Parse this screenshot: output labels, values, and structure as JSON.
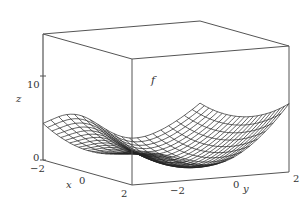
{
  "chart_data": {
    "type": "surface",
    "title": "",
    "function_label": "f",
    "xlabel": "x",
    "ylabel": "y",
    "zlabel": "z",
    "x_ticks": [
      "-2",
      "0",
      "2"
    ],
    "y_ticks": [
      "-2",
      "0",
      "2"
    ],
    "z_ticks": [
      "0",
      "10"
    ],
    "xlim": [
      -2,
      2
    ],
    "ylim": [
      -2,
      2
    ],
    "zlim": [
      0,
      15
    ],
    "grid_resolution": 20,
    "box": true,
    "line_color": "#222222",
    "box_color": "#555555"
  },
  "labels": {
    "z_axis": "z",
    "z_tick_0": "0",
    "z_tick_10": "10",
    "x_axis": "x",
    "x_tick_m2": "−2",
    "x_tick_0": "0",
    "x_tick_2": "2",
    "y_axis": "y",
    "y_tick_m2": "−2",
    "y_tick_0": "0",
    "y_tick_2": "2",
    "f_label": "f"
  }
}
